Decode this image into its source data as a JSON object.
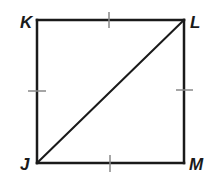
{
  "figure": {
    "type": "square with diagonal",
    "vertices": {
      "K": {
        "label": "K",
        "x": 37,
        "y": 20
      },
      "L": {
        "label": "L",
        "x": 184,
        "y": 20
      },
      "M": {
        "label": "M",
        "x": 184,
        "y": 163
      },
      "J": {
        "label": "J",
        "x": 37,
        "y": 163
      }
    },
    "segments": [
      "KL",
      "LM",
      "MJ",
      "JK",
      "JL"
    ],
    "congruence_ticks": [
      "KL",
      "LM",
      "MJ",
      "JK"
    ],
    "stroke_color": "#1a1a1a",
    "tick_color": "#888888"
  }
}
